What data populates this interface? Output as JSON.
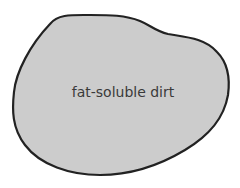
{
  "diagram": {
    "shape": {
      "type": "blob",
      "fill": "#cccccc",
      "stroke": "#222222",
      "label": "fat-soluble dirt"
    }
  }
}
